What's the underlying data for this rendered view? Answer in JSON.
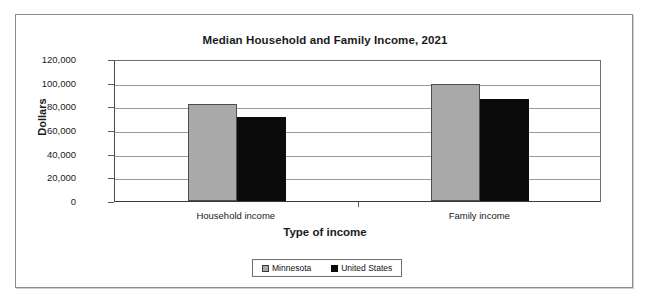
{
  "chart_data": {
    "type": "bar",
    "title": "Median Household and Family Income, 2021",
    "xlabel": "Type of income",
    "ylabel": "Dollars",
    "categories": [
      "Household income",
      "Family income"
    ],
    "series": [
      {
        "name": "Minnesota",
        "color": "#a9a9a9",
        "values": [
          81700,
          98700
        ]
      },
      {
        "name": "United States",
        "color": "#0b0b0b",
        "values": [
          70600,
          86000
        ]
      }
    ],
    "ylim": [
      0,
      120000
    ],
    "ytick_values": [
      120000,
      100000,
      80000,
      60000,
      40000,
      20000,
      0
    ],
    "ytick_labels": [
      "120,000",
      "100,000",
      "80,000",
      "60,000",
      "40,000",
      "20,000",
      "0"
    ],
    "grid": true,
    "legend_position": "bottom"
  }
}
